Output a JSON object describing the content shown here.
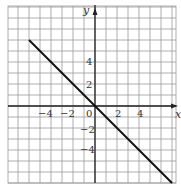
{
  "chart_data": {
    "type": "line",
    "title": "",
    "xlabel": "x",
    "ylabel": "y",
    "xlim": [
      -8,
      7.5
    ],
    "ylim": [
      -7,
      9
    ],
    "grid": true,
    "x_ticks": [
      "-4",
      "-2",
      "0",
      "2",
      "4"
    ],
    "y_ticks": [
      "4",
      "2",
      "-2",
      "-4"
    ],
    "series": [
      {
        "name": "y = -x",
        "x": [
          -6,
          7
        ],
        "y": [
          6,
          -7
        ]
      }
    ],
    "equation": "y = -x",
    "colors": {
      "line": "#111111",
      "grid": "#999999",
      "axis": "#222222"
    }
  },
  "labels": {
    "x_axis": "x",
    "y_axis": "y",
    "origin": "0",
    "x_neg4": "−4",
    "x_neg2": "−2",
    "x_2": "2",
    "x_4": "4",
    "y_4": "4",
    "y_2": "2",
    "y_neg2": "−2",
    "y_neg4": "−4"
  }
}
